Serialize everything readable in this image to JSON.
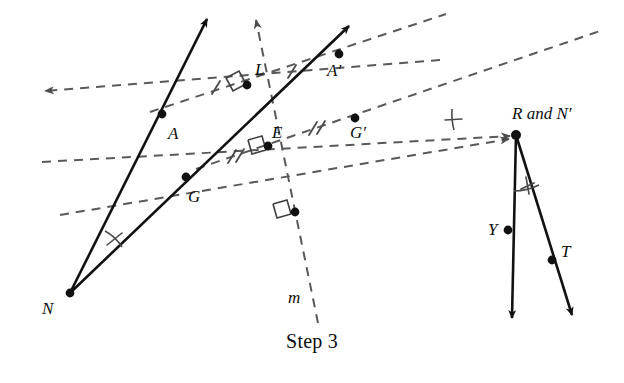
{
  "figure": {
    "caption": "Step 3",
    "colors": {
      "solid_stroke": "#111111",
      "dashed_stroke": "#595959",
      "point_fill": "#111111",
      "text": "#0d0d0d",
      "background": "#ffffff"
    },
    "labels": [
      {
        "id": "A",
        "text": "A",
        "x": 168,
        "y": 133,
        "style": "italic"
      },
      {
        "id": "G",
        "text": "G",
        "x": 188,
        "y": 198,
        "style": "italic"
      },
      {
        "id": "N",
        "text": "N",
        "x": 42,
        "y": 313,
        "style": "italic"
      },
      {
        "id": "L",
        "text": "L",
        "x": 255,
        "y": 75,
        "style": "italic"
      },
      {
        "id": "E",
        "text": "E",
        "x": 274,
        "y": 140,
        "style": "italic"
      },
      {
        "id": "A-prime",
        "text": "A′",
        "x": 326,
        "y": 76,
        "style": "italic"
      },
      {
        "id": "G-prime",
        "text": "G′",
        "x": 353,
        "y": 140,
        "style": "italic"
      },
      {
        "id": "R-and-N-prime",
        "text": "R and N′",
        "x": 512,
        "y": 122,
        "style": "mixed"
      },
      {
        "id": "Y",
        "text": "Y",
        "x": 489,
        "y": 239,
        "style": "italic"
      },
      {
        "id": "T",
        "text": "T",
        "x": 561,
        "y": 258,
        "style": "italic"
      },
      {
        "id": "m",
        "text": "m",
        "x": 292,
        "y": 306,
        "style": "italic"
      }
    ],
    "points": [
      {
        "id": "A",
        "x": 162,
        "y": 114,
        "labeled": true
      },
      {
        "id": "G",
        "x": 186,
        "y": 177,
        "labeled": true
      },
      {
        "id": "N",
        "x": 70,
        "y": 293,
        "labeled": true
      },
      {
        "id": "L",
        "x": 247,
        "y": 85,
        "labeled": true
      },
      {
        "id": "E",
        "x": 268,
        "y": 146,
        "labeled": true
      },
      {
        "id": "A-prime",
        "x": 339,
        "y": 54,
        "labeled": true
      },
      {
        "id": "G-prime",
        "x": 355,
        "y": 118,
        "labeled": true
      },
      {
        "id": "R",
        "x": 516,
        "y": 135,
        "labeled": true
      },
      {
        "id": "Y",
        "x": 508,
        "y": 230,
        "labeled": true
      },
      {
        "id": "T",
        "x": 552,
        "y": 260,
        "labeled": true
      },
      {
        "id": "midpoint-NR",
        "x": 295,
        "y": 212,
        "labeled": false
      }
    ],
    "solid_rays": [
      {
        "id": "ray-N-through-A",
        "from": [
          70,
          293
        ],
        "to": [
          207,
          17
        ]
      },
      {
        "id": "ray-N-through-G",
        "from": [
          70,
          293
        ],
        "to": [
          349,
          24
        ]
      },
      {
        "id": "ray-R-through-Y",
        "from": [
          516,
          135
        ],
        "to": [
          512,
          321
        ]
      },
      {
        "id": "ray-R-through-T",
        "from": [
          516,
          135
        ],
        "to": [
          573,
          318
        ]
      }
    ],
    "dashed_lines": [
      {
        "id": "perp-bisector-A",
        "from": [
          45,
          91
        ],
        "to": [
          440,
          60
        ],
        "arrow": "start"
      },
      {
        "id": "perp-bisector-G",
        "from": [
          42,
          162
        ],
        "to": [
          516,
          135
        ],
        "arrow": "end"
      },
      {
        "id": "perp-bisector-N",
        "from": [
          60,
          215
        ],
        "to": [
          516,
          135
        ],
        "arrow": "end"
      },
      {
        "id": "line-m",
        "from": [
          255,
          18
        ],
        "to": [
          316,
          321
        ],
        "arrow": "start"
      },
      {
        "id": "seg-A-to-Aprime",
        "from": [
          162,
          114
        ],
        "to": [
          516,
          135
        ],
        "arrow": "none"
      },
      {
        "id": "seg-G-to-Gprime",
        "from": [
          186,
          177
        ],
        "to": [
          516,
          135
        ],
        "arrow": "none"
      },
      {
        "id": "seg-Aprime-out",
        "from": [
          339,
          54
        ],
        "to": [
          446,
          14
        ],
        "arrow": "none"
      },
      {
        "id": "seg-Gprime-out",
        "from": [
          355,
          118
        ],
        "to": [
          600,
          31
        ],
        "arrow": "none"
      }
    ],
    "tick_marks": [
      {
        "id": "tick-A-L",
        "count": 1,
        "on": "perp-bisector-A"
      },
      {
        "id": "tick-L-Aprime",
        "count": 1,
        "on": "perp-bisector-A"
      },
      {
        "id": "tick-G-E",
        "count": 2,
        "on": "perp-bisector-G"
      },
      {
        "id": "tick-E-Gprime",
        "count": 2,
        "on": "perp-bisector-G"
      },
      {
        "id": "tick-angle-N",
        "count": 1,
        "on": "angle-N"
      },
      {
        "id": "tick-angle-R",
        "count": 1,
        "on": "angle-R"
      },
      {
        "id": "tick-angle-RYT",
        "count": 1,
        "on": "angle-R-Y-T"
      }
    ],
    "right_angle_marks": [
      {
        "id": "right-angle-L",
        "at": [
          247,
          85
        ]
      },
      {
        "id": "right-angle-E",
        "at": [
          268,
          146
        ]
      },
      {
        "id": "right-angle-midpoint-NR",
        "at": [
          295,
          212
        ]
      }
    ],
    "angle_arcs": [
      {
        "id": "angle-N",
        "vertex": "N",
        "marked": true
      },
      {
        "id": "angle-R",
        "vertex": "R",
        "marked": true
      },
      {
        "id": "angle-R-Y-T",
        "vertex": "R",
        "marked": true
      }
    ]
  }
}
